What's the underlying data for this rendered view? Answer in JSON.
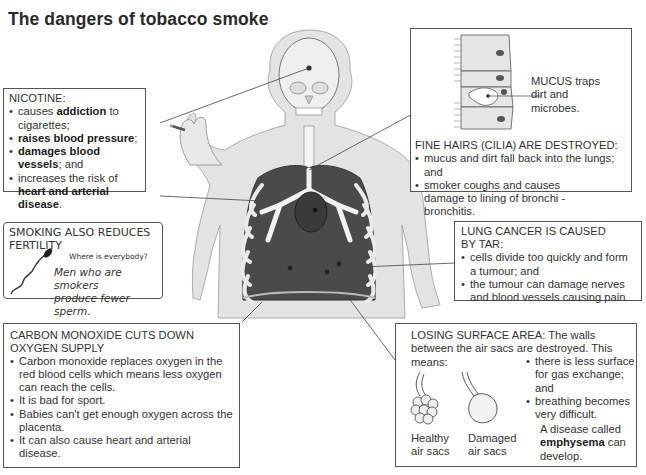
{
  "title": "The dangers of tobacco smoke",
  "nicotine": {
    "heading": "NICOTINE:",
    "items": [
      {
        "pre": "causes ",
        "bold": "addiction",
        "post": " to cigarettes;"
      },
      {
        "pre": "",
        "bold": "raises blood pressure",
        "post": ";"
      },
      {
        "pre": "",
        "bold": "damages blood vessels",
        "post": "; and"
      },
      {
        "pre": "increases the risk of ",
        "bold": "heart and arterial disease",
        "post": "."
      }
    ]
  },
  "fertility": {
    "heading_line1": "SMOKING ALSO REDUCES",
    "heading_line2": "FERTILITY",
    "speech": "Where is everybody?",
    "caption_line1": "Men who are smokers",
    "caption_line2": "produce fewer sperm."
  },
  "carbon_monoxide": {
    "heading_line1": "CARBON MONOXIDE CUTS DOWN",
    "heading_line2": "OXYGEN SUPPLY",
    "items": [
      "Carbon monoxide replaces oxygen in the red blood cells which means less oxygen can reach the cells.",
      "It is bad for sport.",
      "Babies can't get enough oxygen across the placenta.",
      "It can also cause heart and arterial disease."
    ]
  },
  "cilia": {
    "mucus_label_line1": "MUCUS traps",
    "mucus_label_line2": "dirt and",
    "mucus_label_line3": "microbes.",
    "heading": "FINE HAIRS (CILIA) ARE DESTROYED:",
    "items": [
      "mucus and dirt fall back into the lungs; and",
      "smoker coughs and causes damage to lining of bronchi - bronchitis."
    ]
  },
  "lung_cancer": {
    "heading_line1": "LUNG CANCER IS CAUSED",
    "heading_line2": "BY TAR:",
    "items": [
      "cells divide too quickly and form a tumour; and",
      "the tumour can damage nerves and blood vessels causing pain."
    ]
  },
  "surface_area": {
    "heading": "LOSING SURFACE AREA: The walls between the air sacs are destroyed. This means:",
    "items": [
      "there is less surface for gas exchange; and",
      "breathing becomes very difficult."
    ],
    "healthy_label_line1": "Healthy",
    "healthy_label_line2": "air sacs",
    "damaged_label_line1": "Damaged",
    "damaged_label_line2": "air sacs",
    "disease_pre": "A disease called ",
    "disease_bold": "emphysema",
    "disease_post": " can develop."
  },
  "colors": {
    "skin": "#e2e2e2",
    "lung": "#4a4a4a",
    "heart": "#3a3a3a",
    "border": "#555555"
  }
}
